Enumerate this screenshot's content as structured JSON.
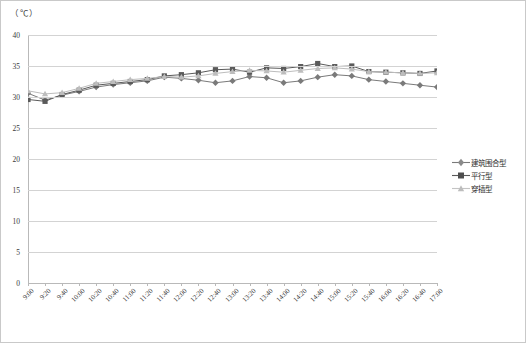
{
  "unit_label": "（℃）",
  "chart_data": {
    "type": "line",
    "title": "",
    "xlabel": "",
    "ylabel": "（℃）",
    "ylim": [
      0,
      40
    ],
    "ytick_step": 5,
    "yticks": [
      0,
      5,
      10,
      15,
      20,
      25,
      30,
      35,
      40
    ],
    "grid": true,
    "legend_position": "right",
    "categories": [
      "9:00",
      "9:20",
      "9:40",
      "10:00",
      "10:20",
      "10:40",
      "11:00",
      "11:20",
      "11:40",
      "12:00",
      "12:20",
      "12:40",
      "13:00",
      "13:20",
      "13:40",
      "14:00",
      "14:20",
      "14:40",
      "15:00",
      "15:20",
      "15:40",
      "16:00",
      "16:20",
      "16:40",
      "17:00"
    ],
    "series": [
      {
        "name": "建筑围合型",
        "marker": "diamond",
        "color": "#7a7a7a",
        "values": [
          30.6,
          29.5,
          30.3,
          30.9,
          31.6,
          32.0,
          32.3,
          32.6,
          33.2,
          33.0,
          32.7,
          32.3,
          32.6,
          33.3,
          33.1,
          32.3,
          32.6,
          33.2,
          33.6,
          33.4,
          32.8,
          32.5,
          32.2,
          31.9,
          31.6
        ]
      },
      {
        "name": "平行型",
        "marker": "square",
        "color": "#5a5a5a",
        "values": [
          29.6,
          29.3,
          30.4,
          31.1,
          31.9,
          32.2,
          32.5,
          32.8,
          33.4,
          33.6,
          33.9,
          34.4,
          34.5,
          34.0,
          34.7,
          34.6,
          34.9,
          35.4,
          34.9,
          35.0,
          34.1,
          34.0,
          33.9,
          33.8,
          34.2
        ]
      },
      {
        "name": "穿插型",
        "marker": "triangle",
        "color": "#bdbdbd",
        "values": [
          31.0,
          30.5,
          30.7,
          31.4,
          32.2,
          32.5,
          32.8,
          33.0,
          33.3,
          33.2,
          33.4,
          33.8,
          34.1,
          34.3,
          34.2,
          34.0,
          34.3,
          34.6,
          34.7,
          34.5,
          34.1,
          34.0,
          33.9,
          33.8,
          33.9
        ]
      }
    ]
  },
  "legend": {
    "items": [
      {
        "label": "建筑围合型"
      },
      {
        "label": "平行型"
      },
      {
        "label": "穿插型"
      }
    ]
  }
}
